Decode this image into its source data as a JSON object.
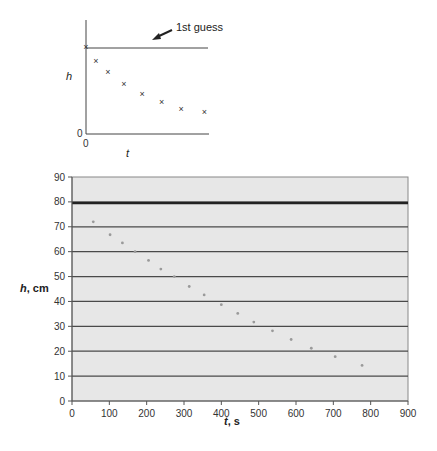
{
  "sketch": {
    "annotation": "1st guess",
    "ylabel": "h",
    "xlabel": "t",
    "y_origin": "0",
    "x_origin": "0"
  },
  "main": {
    "xlabel": "t, s",
    "ylabel": "h, cm"
  },
  "chart_data": [
    {
      "type": "scatter",
      "title": "",
      "description": "Schematic sketch of h vs t with a horizontal '1st guess' line",
      "xlabel": "t",
      "ylabel": "h",
      "annotations": [
        "1st guess"
      ],
      "grid": false,
      "points_relative": [
        [
          0,
          0.76
        ],
        [
          0.08,
          0.64
        ],
        [
          0.18,
          0.54
        ],
        [
          0.31,
          0.44
        ],
        [
          0.46,
          0.35
        ],
        [
          0.62,
          0.28
        ],
        [
          0.78,
          0.22
        ],
        [
          0.97,
          0.19
        ]
      ],
      "guess_line_relative": 0.76
    },
    {
      "type": "scatter",
      "title": "",
      "xlabel": "t, s",
      "ylabel": "h, cm",
      "xlim": [
        0,
        900
      ],
      "ylim": [
        0,
        90
      ],
      "xticks": [
        0,
        100,
        200,
        300,
        400,
        500,
        600,
        700,
        800,
        900
      ],
      "yticks": [
        0,
        10,
        20,
        30,
        40,
        50,
        60,
        70,
        80,
        90
      ],
      "grid": true,
      "guess_line": 79.5,
      "series": [
        {
          "name": "h measurements",
          "x": [
            57,
            102,
            135,
            169,
            205,
            238,
            274,
            314,
            354,
            400,
            444,
            487,
            537,
            587,
            641,
            705,
            777
          ],
          "y": [
            72,
            66.8,
            63.5,
            60,
            56.5,
            53,
            50,
            46,
            42.6,
            38.7,
            35.2,
            31.7,
            28.2,
            24.7,
            21.2,
            17.8,
            14.3
          ]
        }
      ]
    }
  ]
}
